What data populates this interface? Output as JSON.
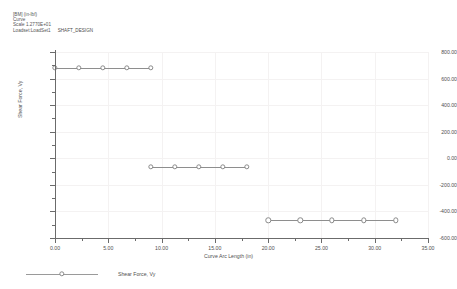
{
  "header": {
    "line1": "[BM]  (in-lbf)",
    "line2": "Curve",
    "line3": "Scale 1.2770E+01",
    "line4": "Loadset:LoadSet1",
    "design_name": "SHAFT_DESIGN"
  },
  "legend": {
    "entries": [
      {
        "label": "Shear Force, Vy",
        "color": "#8e8e8e"
      }
    ]
  },
  "chart_data": {
    "type": "line",
    "title": "",
    "xlabel": "Curve Arc Length (in)",
    "ylabel": "Shear Force, Vy",
    "xlim": [
      0.0,
      35.0
    ],
    "ylim": [
      -600.0,
      800.0
    ],
    "xticks": [
      0.0,
      5.0,
      10.0,
      15.0,
      20.0,
      25.0,
      30.0,
      35.0
    ],
    "xticklabels": [
      "0.00",
      "5.00",
      "10.00",
      "15.00",
      "20.00",
      "25.00",
      "30.00",
      "35.00"
    ],
    "yticks": [
      -600.0,
      -400.0,
      -200.0,
      0.0,
      200.0,
      400.0,
      600.0,
      800.0
    ],
    "yticklabels": [
      "-600.00",
      "-400.00",
      "-200.00",
      "0.00",
      "200.00",
      "400.00",
      "600.00",
      "800.00"
    ],
    "grid": true,
    "legend_position": "bottom-left",
    "series": [
      {
        "name": "Shear Force, Vy",
        "color": "#8e8e8e",
        "marker": "circle",
        "segments": [
          {
            "name": "segment-1",
            "value": 683.0,
            "points": [
              {
                "x": 0.0,
                "y": 683.0
              },
              {
                "x": 2.25,
                "y": 683.0
              },
              {
                "x": 4.5,
                "y": 683.0
              },
              {
                "x": 6.75,
                "y": 683.0
              },
              {
                "x": 9.0,
                "y": 683.0
              }
            ]
          },
          {
            "name": "segment-2",
            "value": -62.0,
            "points": [
              {
                "x": 9.0,
                "y": -62.0
              },
              {
                "x": 11.25,
                "y": -62.0
              },
              {
                "x": 13.5,
                "y": -62.0
              },
              {
                "x": 15.75,
                "y": -62.0
              },
              {
                "x": 18.0,
                "y": -62.0
              }
            ]
          },
          {
            "name": "segment-3",
            "value": -467.0,
            "points": [
              {
                "x": 20.0,
                "y": -467.0
              },
              {
                "x": 23.0,
                "y": -467.0
              },
              {
                "x": 26.0,
                "y": -467.0
              },
              {
                "x": 29.0,
                "y": -467.0
              },
              {
                "x": 32.0,
                "y": -467.0
              }
            ]
          }
        ]
      }
    ]
  }
}
